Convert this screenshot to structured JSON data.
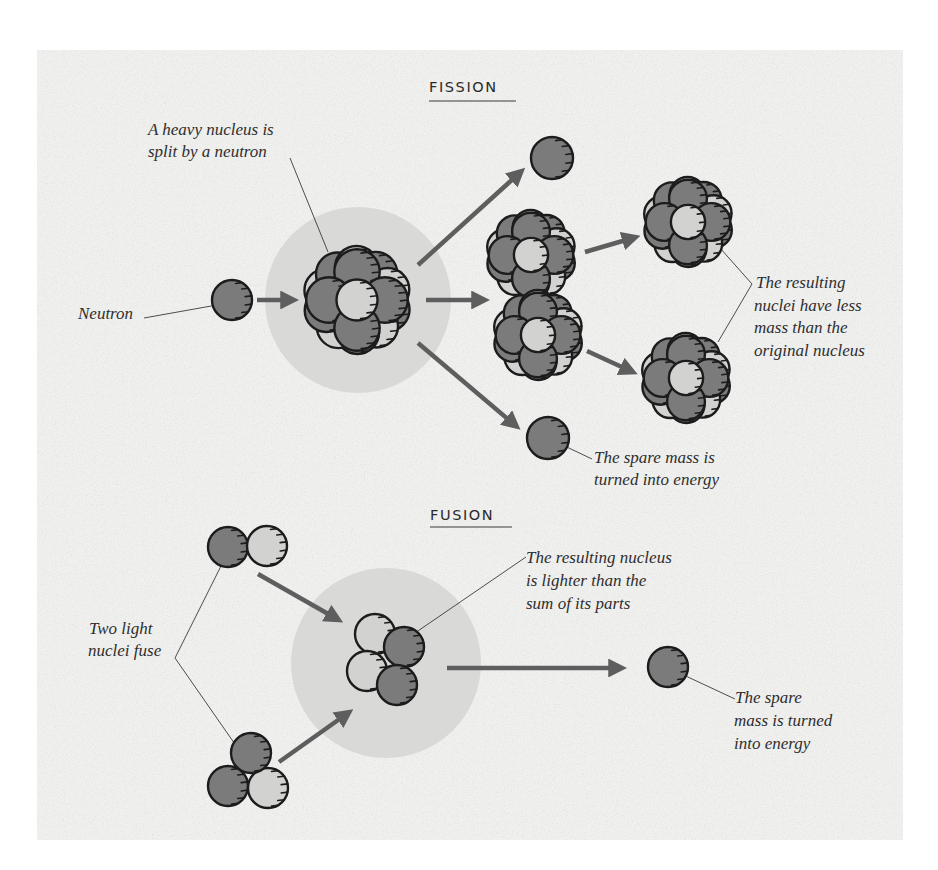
{
  "colors": {
    "page_background": "#ffffff",
    "panel_background": "#f0f0ef",
    "glow": "#d9d9d8",
    "dark_ball": "#7b7b7b",
    "light_ball": "#d2d2d1",
    "arrow": "#5e5e5e",
    "outline": "#1c1c1c",
    "text": "#2e2e2e"
  },
  "panel": {
    "x": 37,
    "y": 50,
    "width": 866,
    "height": 790
  },
  "fission": {
    "heading": "FISSION",
    "heading_pos": {
      "x": 429,
      "y": 92,
      "underline_y": 101,
      "underline_x2": 516
    },
    "labels": {
      "heavy_nucleus": [
        "A heavy nucleus is",
        "split by a neutron"
      ],
      "neutron": "Neutron",
      "resulting_nuclei": [
        "The resulting",
        "nuclei have less",
        "mass than the",
        "original nucleus"
      ],
      "spare_mass": [
        "The spare mass is",
        "turned into energy"
      ]
    },
    "glow": {
      "cx": 358,
      "cy": 300,
      "r": 93
    },
    "neutron": {
      "cx": 232,
      "cy": 300,
      "r": 20
    },
    "heavy_nucleus": {
      "cx": 357,
      "cy": 300
    },
    "fragments": [
      {
        "cx": 531,
        "cy": 255
      },
      {
        "cx": 538,
        "cy": 335
      },
      {
        "cx": 688,
        "cy": 222
      },
      {
        "cx": 686,
        "cy": 378
      }
    ],
    "spare_neutrons": [
      {
        "cx": 552,
        "cy": 158,
        "r": 21
      },
      {
        "cx": 548,
        "cy": 438,
        "r": 21
      }
    ]
  },
  "fusion": {
    "heading": "FUSION",
    "heading_pos": {
      "x": 430,
      "y": 520,
      "underline_y": 527,
      "underline_x2": 512
    },
    "labels": {
      "light_nuclei": [
        "Two light",
        "nuclei fuse"
      ],
      "resulting_nucleus": [
        "The resulting nucleus",
        "is lighter than the",
        "sum of its parts"
      ],
      "spare_mass": [
        "The spare",
        "mass is turned",
        "into energy"
      ]
    },
    "glow": {
      "cx": 386,
      "cy": 663,
      "r": 95
    },
    "input_pair": [
      {
        "cx": 228,
        "cy": 547,
        "r": 20,
        "tone": "dark"
      },
      {
        "cx": 267,
        "cy": 546,
        "r": 20,
        "tone": "light"
      }
    ],
    "input_triplet": [
      {
        "cx": 228,
        "cy": 786,
        "r": 20,
        "tone": "dark"
      },
      {
        "cx": 268,
        "cy": 788,
        "r": 20,
        "tone": "light"
      },
      {
        "cx": 251,
        "cy": 753,
        "r": 20,
        "tone": "dark"
      }
    ],
    "product": [
      {
        "cx": 375,
        "cy": 634,
        "r": 20,
        "tone": "light"
      },
      {
        "cx": 367,
        "cy": 671,
        "r": 20,
        "tone": "light"
      },
      {
        "cx": 404,
        "cy": 647,
        "r": 20,
        "tone": "dark"
      },
      {
        "cx": 397,
        "cy": 685,
        "r": 20,
        "tone": "dark"
      }
    ],
    "spare_neutron": {
      "cx": 668,
      "cy": 667,
      "r": 20
    }
  }
}
